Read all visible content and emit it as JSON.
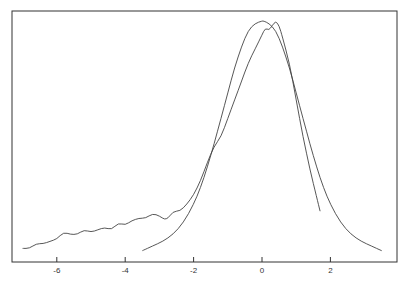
{
  "chart_data": {
    "type": "line",
    "title": "",
    "xlabel": "",
    "ylabel": "",
    "xlim": [
      -7.4,
      3.9
    ],
    "ylim": [
      0,
      1.05
    ],
    "grid": false,
    "legend": "none",
    "xticks": [
      -6,
      -4,
      -2,
      0,
      2
    ],
    "xtick_labels": [
      "-6",
      "-4",
      "-2",
      "0",
      "2"
    ],
    "series": [
      {
        "name": "empirical",
        "x": [
          -7.0,
          -6.8,
          -6.6,
          -6.4,
          -6.2,
          -6.0,
          -5.8,
          -5.6,
          -5.4,
          -5.2,
          -5.0,
          -4.8,
          -4.6,
          -4.4,
          -4.2,
          -4.0,
          -3.8,
          -3.6,
          -3.4,
          -3.2,
          -3.0,
          -2.8,
          -2.6,
          -2.4,
          -2.2,
          -2.0,
          -1.8,
          -1.6,
          -1.4,
          -1.2,
          -1.0,
          -0.8,
          -0.6,
          -0.4,
          -0.2,
          0.0,
          0.1,
          0.2,
          0.3,
          0.4,
          0.5,
          0.6,
          0.8,
          1.0,
          1.2,
          1.4,
          1.6,
          1.7
        ],
        "y": [
          0.02,
          0.02,
          0.04,
          0.04,
          0.05,
          0.06,
          0.09,
          0.08,
          0.08,
          0.1,
          0.09,
          0.1,
          0.11,
          0.1,
          0.13,
          0.12,
          0.14,
          0.15,
          0.15,
          0.17,
          0.16,
          0.14,
          0.18,
          0.18,
          0.21,
          0.25,
          0.31,
          0.39,
          0.46,
          0.5,
          0.58,
          0.66,
          0.74,
          0.82,
          0.88,
          0.94,
          0.97,
          0.96,
          0.98,
          1.0,
          0.98,
          0.93,
          0.82,
          0.66,
          0.5,
          0.36,
          0.24,
          0.18
        ]
      },
      {
        "name": "fitted",
        "x": [
          -3.5,
          -3.2,
          -2.9,
          -2.6,
          -2.3,
          -2.0,
          -1.8,
          -1.6,
          -1.4,
          -1.2,
          -1.0,
          -0.8,
          -0.6,
          -0.4,
          -0.2,
          0.0,
          0.05,
          0.2,
          0.4,
          0.6,
          0.8,
          1.0,
          1.2,
          1.4,
          1.6,
          1.8,
          2.0,
          2.3,
          2.6,
          2.9,
          3.2,
          3.5
        ],
        "y": [
          0.01,
          0.03,
          0.05,
          0.08,
          0.13,
          0.21,
          0.28,
          0.37,
          0.47,
          0.58,
          0.69,
          0.8,
          0.89,
          0.96,
          0.99,
          1.0,
          1.0,
          0.99,
          0.96,
          0.89,
          0.8,
          0.69,
          0.58,
          0.47,
          0.37,
          0.28,
          0.21,
          0.13,
          0.08,
          0.05,
          0.03,
          0.01
        ]
      }
    ]
  }
}
